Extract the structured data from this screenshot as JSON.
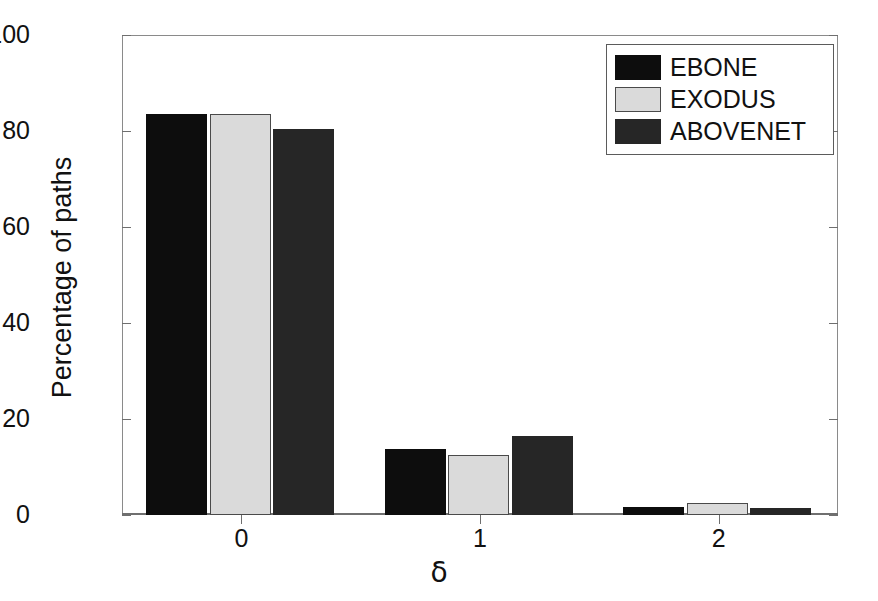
{
  "chart_data": {
    "type": "bar",
    "title": "",
    "xlabel": "δ",
    "ylabel": "Percentage of paths",
    "categories": [
      "0",
      "1",
      "2"
    ],
    "xtick_labels": [
      "0",
      "1",
      "2"
    ],
    "ytick_labels": [
      "0",
      "20",
      "40",
      "60",
      "80",
      "100"
    ],
    "yticks": [
      0,
      20,
      40,
      60,
      80,
      100
    ],
    "ylim": [
      0,
      100
    ],
    "xlim": [
      -0.5,
      2.5
    ],
    "grid": false,
    "legend_position": "upper right",
    "series": [
      {
        "name": "EBONE",
        "values": [
          83.5,
          13.8,
          1.7
        ],
        "color": "#0d0d0d"
      },
      {
        "name": "EXODUS",
        "values": [
          83.5,
          12.5,
          2.4
        ],
        "color": "#dadada"
      },
      {
        "name": "ABOVENET",
        "values": [
          80.5,
          16.5,
          1.4
        ],
        "color": "#262626"
      }
    ]
  },
  "legend": {
    "items": [
      {
        "label": "EBONE",
        "swatch": "ebone"
      },
      {
        "label": "EXODUS",
        "swatch": "exodus"
      },
      {
        "label": "ABOVENET",
        "swatch": "abovenet"
      }
    ]
  },
  "axes": {
    "y_title": "Percentage of paths",
    "x_title": "δ"
  }
}
